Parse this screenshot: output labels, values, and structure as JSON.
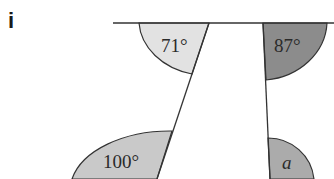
{
  "question_label": "i",
  "angles": [
    {
      "id": "top-left",
      "label": "71°",
      "fill": "#e2e2e2"
    },
    {
      "id": "top-right",
      "label": "87°",
      "fill": "#8c8c8c"
    },
    {
      "id": "bottom-left",
      "label": "100°",
      "fill": "#c9c9c9"
    },
    {
      "id": "bottom-right",
      "label": "a",
      "fill": "#ababab"
    }
  ],
  "colors": {
    "line": "#333333",
    "background": "#ffffff"
  }
}
